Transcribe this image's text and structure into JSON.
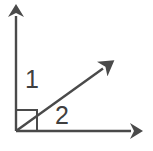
{
  "figure": {
    "background_color": "#ffffff",
    "stroke_color": "#4a4a4a",
    "label_color": "#3f3f3f",
    "stroke_width": 2.4,
    "width": 153,
    "height": 151,
    "vertex": {
      "x": 16,
      "y": 131
    },
    "rays": [
      {
        "name": "vertical-ray",
        "from": {
          "x": 16,
          "y": 131
        },
        "to": {
          "x": 16,
          "y": 10
        },
        "arrow": "up"
      },
      {
        "name": "diagonal-ray",
        "from": {
          "x": 16,
          "y": 131
        },
        "to": {
          "x": 115,
          "y": 60
        },
        "arrow": "upper-right"
      },
      {
        "name": "horizontal-ray",
        "from": {
          "x": 16,
          "y": 131
        },
        "to": {
          "x": 145,
          "y": 131
        },
        "arrow": "right"
      }
    ],
    "right_angle_marker": {
      "name": "right-angle-square",
      "size": 21,
      "corner": {
        "x": 16,
        "y": 131
      },
      "orientation": "up-right"
    },
    "labels": [
      {
        "id": "1",
        "text": "1",
        "region": "between-vertical-ray-and-diagonal-ray"
      },
      {
        "id": "2",
        "text": "2",
        "region": "between-diagonal-ray-and-horizontal-ray"
      }
    ]
  }
}
